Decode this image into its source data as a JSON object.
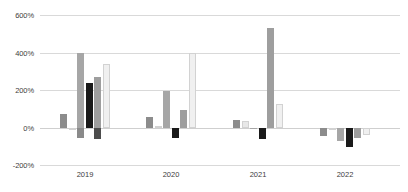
{
  "chart_data": {
    "type": "bar",
    "title": "",
    "xlabel": "",
    "ylabel": "",
    "ylim": [
      -200,
      600
    ],
    "grid": true,
    "legend": "none",
    "y_ticks": [
      "600%",
      "400%",
      "200%",
      "0%",
      "-200%"
    ],
    "y_tick_values": [
      600,
      400,
      200,
      0,
      -200
    ],
    "categories": [
      "2019",
      "2020",
      "2021",
      "2022"
    ],
    "series": [
      {
        "name": "Series 1",
        "color": "#8c8c8c",
        "values": [
          70,
          55,
          40,
          -45
        ]
      },
      {
        "name": "Series 2",
        "color": "#e8e8e8",
        "values": [
          -10,
          10,
          35,
          -8
        ]
      },
      {
        "name": "Series 3",
        "color": "#a6a6a6",
        "values": [
          400,
          195,
          -5,
          -70
        ]
      },
      {
        "name": "Series 4",
        "color": "#1a1a1a",
        "values": [
          235,
          -55,
          -60,
          -105
        ]
      },
      {
        "name": "Series 5",
        "color": "#9e9e9e",
        "values": [
          270,
          95,
          530,
          -55
        ]
      },
      {
        "name": "Series 6",
        "color": "#f0f0f0",
        "values": [
          340,
          395,
          125,
          -40
        ]
      }
    ],
    "series_extra": [
      {
        "name": "Series 3b",
        "color": "#8a8a8a",
        "values": [
          -55,
          0,
          0,
          0
        ]
      },
      {
        "name": "Series 4b",
        "color": "#4d4d4d",
        "values": [
          -60,
          0,
          0,
          0
        ]
      }
    ]
  },
  "axis": {
    "y_labels": [
      "600%",
      "400%",
      "200%",
      "0%",
      "-200%"
    ],
    "x_labels": [
      "2019",
      "2020",
      "2021",
      "2022"
    ]
  }
}
